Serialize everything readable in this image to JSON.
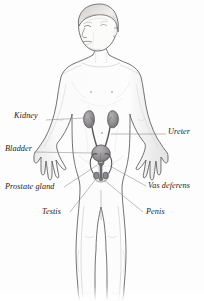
{
  "figure": {
    "background_color": "#fdfdfd",
    "outline_color": "#4a4a4a",
    "skin_fill": "#fbfbfa",
    "organ_fill": "#8e8c8e",
    "leader_color": "#7b7b7b",
    "text_color": "#1a1a1a"
  },
  "labels": [
    {
      "id": "kidney",
      "text": "Kidney",
      "side": "left",
      "x": 14,
      "y": 117
    },
    {
      "id": "bladder",
      "text": "Bladder",
      "side": "left",
      "x": 5,
      "y": 150
    },
    {
      "id": "prostate-gland",
      "text": "Prostate gland",
      "side": "left",
      "x": 5,
      "y": 189
    },
    {
      "id": "testis",
      "text": "Testis",
      "side": "left",
      "x": 42,
      "y": 215
    },
    {
      "id": "ureter",
      "text": "Ureter",
      "side": "right",
      "x": 168,
      "y": 132
    },
    {
      "id": "vas-deferens",
      "text": "Vas deferens",
      "side": "right",
      "x": 148,
      "y": 189
    },
    {
      "id": "penis",
      "text": "Penis",
      "side": "right",
      "x": 146,
      "y": 215
    }
  ],
  "organs": [
    {
      "id": "kidney-left",
      "name": "Kidney"
    },
    {
      "id": "kidney-right",
      "name": "Kidney"
    },
    {
      "id": "ureter-left",
      "name": "Ureter"
    },
    {
      "id": "ureter-right",
      "name": "Ureter"
    },
    {
      "id": "bladder",
      "name": "Bladder"
    },
    {
      "id": "prostate",
      "name": "Prostate gland"
    },
    {
      "id": "testis-left",
      "name": "Testis"
    },
    {
      "id": "testis-right",
      "name": "Testis"
    },
    {
      "id": "vas-deferens-left",
      "name": "Vas deferens"
    },
    {
      "id": "vas-deferens-right",
      "name": "Vas deferens"
    },
    {
      "id": "penis",
      "name": "Penis"
    }
  ],
  "body": {
    "figure_type": "standing boy, front view, arms out, legs cropped at image bottom",
    "head_direction": "turned to subject's right"
  }
}
